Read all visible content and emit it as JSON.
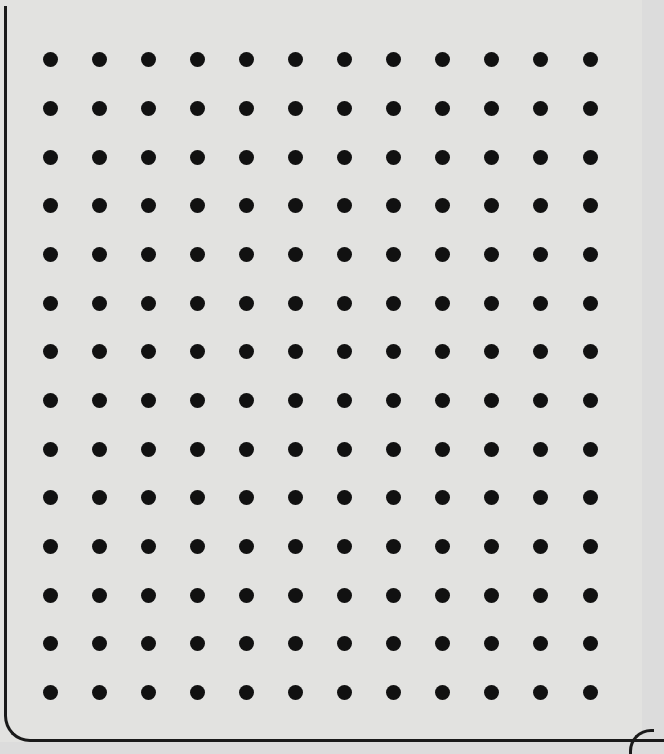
{
  "worksheet": {
    "type": "dot-grid",
    "columns": 12,
    "rows": 14,
    "dot_color": "#111111",
    "paper_color": "#e2e2e0",
    "border_color": "#1a1a1a",
    "col_x": [
      50,
      99,
      148,
      197,
      246,
      295,
      344,
      393,
      442,
      491,
      540,
      590
    ],
    "row_y": [
      59,
      108,
      157,
      205,
      254,
      303,
      351,
      400,
      449,
      497,
      546,
      595,
      643,
      692
    ]
  }
}
